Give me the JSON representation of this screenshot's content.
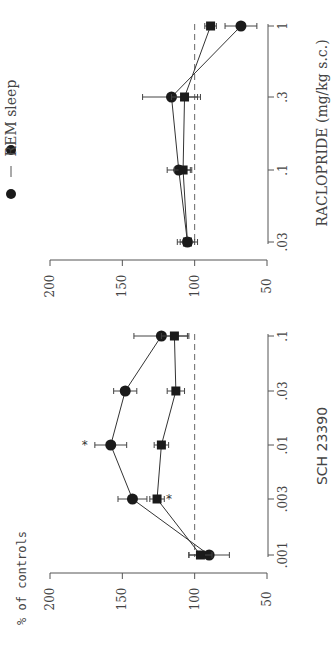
{
  "legend": {
    "label": "REM sleep",
    "marker": "filled-circle"
  },
  "chart_data": [
    {
      "type": "line",
      "title": "",
      "xlabel": "RACLOPRIDE (mg/kg s.c.)",
      "ylabel": "% of controls",
      "x_scale": "log",
      "categories": [
        ".03",
        ".1",
        ".3",
        "1"
      ],
      "x": [
        0.03,
        0.1,
        0.3,
        1
      ],
      "ylim": [
        50,
        200
      ],
      "yticks": [
        200,
        150,
        100,
        50
      ],
      "reference_line": 100,
      "orientation": "rotated-90-ccw",
      "series": [
        {
          "name": "circle",
          "marker": "circle",
          "values": [
            105,
            111,
            116,
            68
          ],
          "errors": [
            7,
            8,
            20,
            11
          ]
        },
        {
          "name": "square",
          "marker": "square",
          "values": [
            105,
            108,
            107,
            89
          ],
          "errors": [
            5,
            6,
            9,
            4
          ]
        }
      ],
      "annotations": []
    },
    {
      "type": "line",
      "title": "",
      "xlabel": "SCH 23390",
      "ylabel": "% of controls",
      "x_scale": "log",
      "categories": [
        ".001",
        ".003",
        ".01",
        ".03",
        ".1"
      ],
      "x": [
        0.001,
        0.003,
        0.01,
        0.03,
        0.1
      ],
      "ylim": [
        50,
        200
      ],
      "yticks": [
        200,
        150,
        100,
        50
      ],
      "reference_line": 100,
      "orientation": "rotated-90-ccw",
      "series": [
        {
          "name": "circle",
          "marker": "circle",
          "values": [
            90,
            143,
            158,
            148,
            123
          ],
          "errors": [
            14,
            10,
            11,
            8,
            19
          ]
        },
        {
          "name": "square",
          "marker": "square",
          "values": [
            96,
            126,
            123,
            113,
            114
          ],
          "errors": [
            8,
            5,
            5,
            6,
            9
          ]
        }
      ],
      "annotations": [
        {
          "text": "*",
          "series": "circle",
          "x": 0.01
        },
        {
          "text": "*",
          "series": "square",
          "x": 0.003
        }
      ]
    }
  ],
  "labels": {
    "top_xlabel": "RACLOPRIDE (mg/kg s.c.)",
    "bottom_xlabel": "SCH 23390",
    "ylabel": "% of controls",
    "yticks": [
      "200",
      "150",
      "100",
      "50"
    ],
    "top_xticks": [
      ".03",
      ".1",
      ".3",
      "1"
    ],
    "bottom_xticks": [
      ".001",
      ".003",
      ".01",
      ".03",
      ".1"
    ],
    "star": "*"
  }
}
